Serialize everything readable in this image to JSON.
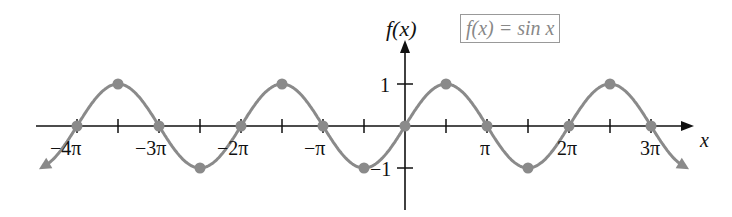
{
  "chart_data": {
    "type": "line",
    "title": "f(x) = sin x",
    "xlabel": "x",
    "ylabel": "f(x)",
    "x_ticks": [
      "-4π",
      "-3π",
      "-2π",
      "-π",
      "π",
      "2π",
      "3π"
    ],
    "y_ticks": [
      "1",
      "-1"
    ],
    "xlim": [
      "-4.2π",
      "3.35π"
    ],
    "ylim": [
      -1.9,
      2.1
    ],
    "series": [
      {
        "name": "sin x",
        "color": "#8a8a8a",
        "marked_points": [
          {
            "x": "-4π",
            "y": 0
          },
          {
            "x": "-7π/2",
            "y": 1
          },
          {
            "x": "-3π",
            "y": 0
          },
          {
            "x": "-5π/2",
            "y": -1
          },
          {
            "x": "-2π",
            "y": 0
          },
          {
            "x": "-3π/2",
            "y": 1
          },
          {
            "x": "-π",
            "y": 0
          },
          {
            "x": "-π/2",
            "y": -1
          },
          {
            "x": "0",
            "y": 0
          },
          {
            "x": "π/2",
            "y": 1
          },
          {
            "x": "π",
            "y": 0
          },
          {
            "x": "3π/2",
            "y": -1
          },
          {
            "x": "2π",
            "y": 0
          },
          {
            "x": "5π/2",
            "y": 1
          },
          {
            "x": "3π",
            "y": 0
          }
        ]
      }
    ],
    "grid": false,
    "legend_position": "top-right"
  },
  "labels": {
    "ylabel": "f(x)",
    "xlabel": "x",
    "legend": "f(x) = sin x",
    "y_one": "1",
    "y_neg_one": "−1",
    "x_ticks": [
      "−4π",
      "−3π",
      "−2π",
      "−π",
      "π",
      "2π",
      "3π"
    ]
  }
}
